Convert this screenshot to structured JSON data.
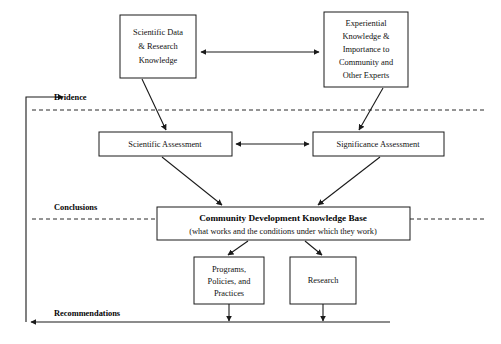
{
  "diagram": {
    "background_color": "#ffffff",
    "line_color": "#1a1a1a",
    "nodes": {
      "scientific_data": {
        "lines": [
          "Scientific Data",
          "& Research",
          "Knowledge"
        ],
        "x": 120,
        "y": 15,
        "w": 76,
        "h": 63
      },
      "experiential_knowledge": {
        "lines": [
          "Experiential",
          "Knowledge &",
          "Importance to",
          "Community and",
          "Other Experts"
        ],
        "x": 324,
        "y": 12,
        "w": 84,
        "h": 75
      },
      "scientific_assessment": {
        "lines": [
          "Scientific Assessment"
        ],
        "x": 99,
        "y": 132,
        "w": 133,
        "h": 24
      },
      "significance_assessment": {
        "lines": [
          "Significance Assessment"
        ],
        "x": 313,
        "y": 132,
        "w": 131,
        "h": 24
      },
      "knowledge_base": {
        "title": "Community Development Knowledge Base",
        "subtitle": "(what works and the conditions under which they work)",
        "x": 157,
        "y": 207,
        "w": 253,
        "h": 33
      },
      "programs_policies": {
        "lines": [
          "Programs,",
          "Policies, and",
          "Practices"
        ],
        "x": 194,
        "y": 257,
        "w": 70,
        "h": 47
      },
      "research": {
        "lines": [
          "Research"
        ],
        "x": 290,
        "y": 257,
        "w": 66,
        "h": 47
      }
    },
    "band_labels": [
      {
        "id": "evidence",
        "text": "Evidence",
        "x": 54,
        "y": 100
      },
      {
        "id": "conclusions",
        "text": "Conclusions",
        "x": 54,
        "y": 210
      },
      {
        "id": "recommendations",
        "text": "Recommendations",
        "x": 54,
        "y": 316
      }
    ],
    "dividers": [
      {
        "id": "evidence-divider",
        "x1": 32,
        "y1": 110,
        "x2": 487,
        "y2": 110
      },
      {
        "id": "conclusions-divider",
        "x1": 32,
        "y1": 219,
        "x2": 487,
        "y2": 219
      }
    ],
    "feedback_loop": {
      "label": "recommendations-feedback-loop",
      "bottom_y": 322,
      "left_x": 26,
      "top_y": 97,
      "right_x": 390
    },
    "connectors": [
      {
        "id": "top-boxes-bidirectional",
        "type": "double"
      },
      {
        "id": "assessments-bidirectional",
        "type": "double"
      },
      {
        "id": "scientific-data-to-scientific-assessment",
        "type": "single"
      },
      {
        "id": "experiential-to-significance-assessment",
        "type": "single"
      },
      {
        "id": "scientific-assessment-to-knowledge-base",
        "type": "single"
      },
      {
        "id": "significance-assessment-to-knowledge-base",
        "type": "single"
      },
      {
        "id": "knowledge-base-to-programs",
        "type": "single"
      },
      {
        "id": "knowledge-base-to-research",
        "type": "single"
      },
      {
        "id": "programs-to-feedback",
        "type": "single"
      },
      {
        "id": "research-to-feedback",
        "type": "single"
      }
    ]
  }
}
